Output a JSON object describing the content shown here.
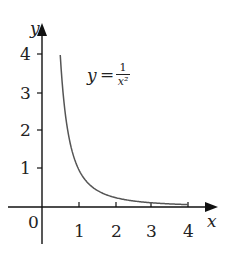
{
  "chart_data": {
    "type": "line",
    "title": "",
    "xlabel": "x",
    "ylabel": "y",
    "annotation": {
      "lhs": "y",
      "eq": "=",
      "numerator": "1",
      "denominator": "x²"
    },
    "function": "y = 1/x^2",
    "x_ticks": [
      "1",
      "2",
      "3",
      "4"
    ],
    "y_ticks": [
      "1",
      "2",
      "3",
      "4"
    ],
    "origin_label": "0",
    "xlim": [
      -1,
      4.6
    ],
    "ylim": [
      -1,
      4.6
    ],
    "grid": false,
    "legend": "none",
    "series": [
      {
        "name": "y = 1/x²",
        "x": [
          0.5,
          0.6,
          0.7,
          0.8,
          1.0,
          1.25,
          1.5,
          2.0,
          2.5,
          3.0,
          3.5,
          4.0
        ],
        "y": [
          4.0,
          2.78,
          2.04,
          1.56,
          1.0,
          0.64,
          0.44,
          0.25,
          0.16,
          0.11,
          0.08,
          0.06
        ]
      }
    ],
    "colors": {
      "axis": "#111111",
      "curve": "#555555"
    }
  }
}
